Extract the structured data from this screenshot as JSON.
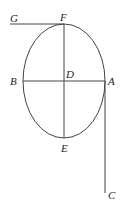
{
  "diagram": {
    "type": "geometry-figure",
    "shape": "ellipse with axes and tangent lines",
    "labels": {
      "G": "G",
      "F": "F",
      "B": "B",
      "D": "D",
      "A": "A",
      "E": "E",
      "C": "C"
    },
    "colors": {
      "stroke": "#444444",
      "text": "#222222",
      "background": "#ffffff"
    }
  }
}
